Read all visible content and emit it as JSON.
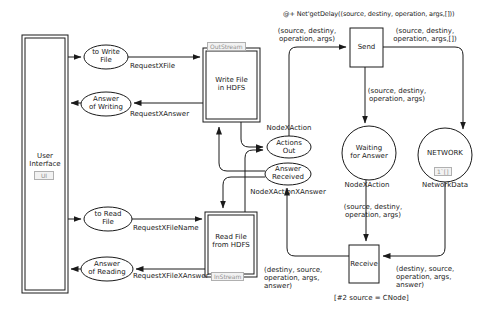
{
  "title_annotation": "@+ Net'getDelay((source, destiny, operation, args,[]))",
  "guard": "[#2 source = CNode]",
  "nodes": {
    "user_interface": {
      "label": "User\nInterface",
      "tag": "UI"
    },
    "to_write_file": {
      "label": "to Write\nFile"
    },
    "answer_of_writing": {
      "label": "Answer\nof Writing"
    },
    "to_read_file": {
      "label": "to Read\nFile"
    },
    "answer_of_reading": {
      "label": "Answer\nof Reading"
    },
    "write_file_hdfs": {
      "label": "Write File\nin HDFS",
      "tag": "OutStream"
    },
    "read_file_hdfs": {
      "label": "Read File\nfrom HDFS",
      "tag": "InStream"
    },
    "actions_out": {
      "label": "Actions\nOut",
      "type": "NodeXAction"
    },
    "answer_received": {
      "label": "Answer\nReceived",
      "type": "NodeXActionXAnswer"
    },
    "send": {
      "label": "Send"
    },
    "receive": {
      "label": "Receive"
    },
    "waiting_for_answer": {
      "label": "Waiting\nfor Answer",
      "type": "NodeXAction"
    },
    "network": {
      "label": "NETWORK",
      "type": "NetworkData",
      "marking": "1`[]"
    }
  },
  "arc_labels": {
    "request_x_file": "RequestXFile",
    "request_x_answer": "RequestXAnswer",
    "request_x_file_name": "RequestXFileName",
    "request_x_file_x_answer": "RequestXFileXAnswer",
    "actions_out_to_send": "(source, destiny,\noperation, args)",
    "send_to_network": "(source, destiny,\noperation, args,[])",
    "send_to_waiting": "(source, destiny,\noperation, args)",
    "waiting_to_receive": "(source, destiny,\noperation, args)",
    "network_to_receive": "(destiny, source,\noperation, args,\nanswer)",
    "receive_to_answer_received": "(destiny, source,\noperation, args,\nanswer)"
  },
  "colors": {
    "line": "#1a1a1a",
    "tag_bg": "#f2f2f2",
    "tag_border": "#b0b0b0",
    "tag_text": "#909090"
  }
}
